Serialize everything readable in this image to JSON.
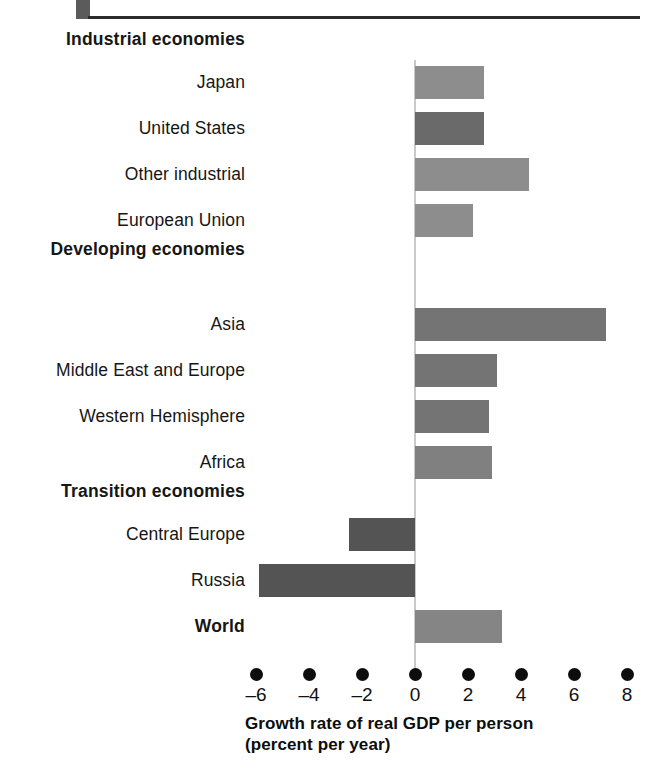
{
  "header": {
    "rule_color": "#2b2b2b",
    "tab_color": "#5b5b5b"
  },
  "caption": {
    "line1": "Growth rate of real GDP per person",
    "line2": "(percent per year)"
  },
  "axis": {
    "tick_labels": [
      "–6",
      "–4",
      "–2",
      "0",
      "2",
      "4",
      "6",
      "8"
    ],
    "tick_values": [
      -6,
      -4,
      -2,
      0,
      2,
      4,
      6,
      8
    ],
    "zero_line_color": "#c9c9c9",
    "dot_color": "#0d0d0d"
  },
  "groups": [
    {
      "label": "Industrial economies"
    },
    {
      "label": "Developing economies"
    },
    {
      "label": "Transition economies"
    }
  ],
  "chart_data": {
    "type": "bar",
    "orientation": "horizontal",
    "title": "",
    "xlabel": "Growth rate of real GDP per person (percent per year)",
    "ylabel": "",
    "xlim": [
      -6,
      8
    ],
    "xticks": [
      -6,
      -4,
      -2,
      0,
      2,
      4,
      6,
      8
    ],
    "grid": false,
    "legend": "none",
    "categories": [
      "Industrial economies",
      "Japan",
      "United States",
      "Other industrial",
      "European Union",
      "Developing economies",
      "Asia",
      "Middle East and Europe",
      "Western Hemisphere",
      "Africa",
      "Transition economies",
      "Central Europe",
      "Russia",
      "World"
    ],
    "rows": [
      {
        "label": "Industrial economies",
        "is_group": true,
        "value": null,
        "color": null,
        "top": 40,
        "height": 0
      },
      {
        "label": "Japan",
        "is_group": false,
        "value": 2.6,
        "color": "#8d8d8d",
        "top": 66,
        "height": 33
      },
      {
        "label": "United States",
        "is_group": false,
        "value": 2.6,
        "color": "#6a6a6a",
        "top": 112,
        "height": 33
      },
      {
        "label": "Other industrial",
        "is_group": false,
        "value": 4.3,
        "color": "#8d8d8d",
        "top": 158,
        "height": 33
      },
      {
        "label": "European Union",
        "is_group": false,
        "value": 2.2,
        "color": "#8d8d8d",
        "top": 204,
        "height": 33
      },
      {
        "label": "Developing economies",
        "is_group": true,
        "value": null,
        "color": null,
        "top": 250,
        "height": 0
      },
      {
        "label": "Asia",
        "is_group": false,
        "value": 7.2,
        "color": "#747474",
        "top": 308,
        "height": 33
      },
      {
        "label": "Middle East and Europe",
        "is_group": false,
        "value": 3.1,
        "color": "#747474",
        "top": 354,
        "height": 33
      },
      {
        "label": "Western Hemisphere",
        "is_group": false,
        "value": 2.8,
        "color": "#747474",
        "top": 400,
        "height": 33
      },
      {
        "label": "Africa",
        "is_group": false,
        "value": 2.9,
        "color": "#808080",
        "top": 446,
        "height": 33
      },
      {
        "label": "Transition economies",
        "is_group": true,
        "value": null,
        "color": null,
        "top": 492,
        "height": 0
      },
      {
        "label": "Central Europe",
        "is_group": false,
        "value": -2.5,
        "color": "#545454",
        "top": 518,
        "height": 33
      },
      {
        "label": "Russia",
        "is_group": false,
        "value": -5.9,
        "color": "#545454",
        "top": 564,
        "height": 33
      },
      {
        "label": "World",
        "is_group": true,
        "value": 3.3,
        "color": "#858585",
        "top": 610,
        "height": 33
      }
    ]
  },
  "geometry": {
    "zero_x": 415,
    "px_per_unit": 26.5,
    "axis_dot_y": 668,
    "bar_area_top": 60
  }
}
